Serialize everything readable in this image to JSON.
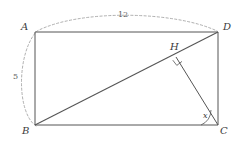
{
  "figure": {
    "type": "geometry-diagram",
    "background_color": "#ffffff",
    "line_color": "#555555",
    "dash_color": "#9a9a9a",
    "text_color": "#3b3b3b"
  },
  "vertices": {
    "A": {
      "label": "A",
      "x": 35,
      "y": 32,
      "label_x": 21,
      "label_y": 22
    },
    "B": {
      "label": "B",
      "x": 35,
      "y": 125,
      "label_x": 22,
      "label_y": 126
    },
    "C": {
      "label": "C",
      "x": 218,
      "y": 125,
      "label_x": 220,
      "label_y": 126
    },
    "D": {
      "label": "D",
      "x": 218,
      "y": 32,
      "label_x": 223,
      "label_y": 22
    },
    "H": {
      "label": "H",
      "x": 176,
      "y": 57,
      "label_x": 170,
      "label_y": 42
    }
  },
  "measures": {
    "top_length": {
      "value": "12",
      "label_x": 118,
      "label_y": 11
    },
    "left_length": {
      "value": "5",
      "label_x": 13,
      "label_y": 73
    },
    "angle_at_c": {
      "value": "x",
      "label_x": 203,
      "label_y": 112
    }
  },
  "segments": [
    {
      "name": "side-AD",
      "from": "A",
      "to": "D"
    },
    {
      "name": "side-DC",
      "from": "D",
      "to": "C"
    },
    {
      "name": "side-CB",
      "from": "C",
      "to": "B"
    },
    {
      "name": "side-BA",
      "from": "B",
      "to": "A"
    },
    {
      "name": "diagonal-BD",
      "from": "B",
      "to": "D"
    },
    {
      "name": "altitude-CH",
      "from": "C",
      "to": "H"
    }
  ],
  "arcs": {
    "dimension_arc": {
      "name": "dimension-arc-B-A-D",
      "path": "M 36 126 C 16 112 17 52 37 31 C 80 9 175 11 217 31",
      "dashed": true
    },
    "angle_arc": {
      "name": "angle-arc-at-c",
      "path": "M 201 125 A 17 17 0 0 0 211 110"
    }
  },
  "right_angle_mark": {
    "name": "right-angle-mark-at-h",
    "path": "M 172.8 60.2 L 176.8 65.4 L 182.0 61.4"
  }
}
